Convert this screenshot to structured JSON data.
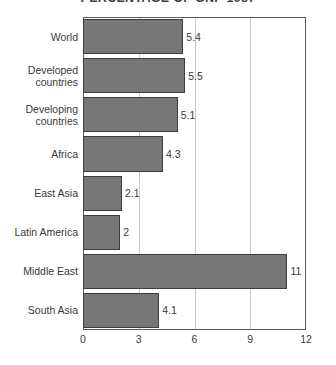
{
  "chart_data": {
    "type": "bar",
    "orientation": "horizontal",
    "title": "PERCENTAGE OF GNP 1987",
    "xlabel": "",
    "ylabel": "",
    "xlim": [
      0,
      12
    ],
    "xticks": [
      "0",
      "3",
      "6",
      "9",
      "12"
    ],
    "xtick_values": [
      0,
      3,
      6,
      9,
      12
    ],
    "grid": "vertical",
    "legend": "none",
    "categories": [
      "World",
      "Developed countries",
      "Developing countries",
      "Africa",
      "East Asia",
      "Latin America",
      "Middle East",
      "South Asia"
    ],
    "values": [
      5.4,
      5.5,
      5.1,
      4.3,
      2.1,
      2,
      11,
      4.1
    ],
    "data_labels": [
      "5.4",
      "5.5",
      "5.1",
      "4.3",
      "2.1",
      "2",
      "11",
      "4.1"
    ],
    "bars": [
      {
        "label": "World",
        "label_lines": [
          "World"
        ],
        "value": 5.4,
        "data_label": "5.4"
      },
      {
        "label": "Developed countries",
        "label_lines": [
          "Developed",
          "countries"
        ],
        "value": 5.5,
        "data_label": "5.5"
      },
      {
        "label": "Developing countries",
        "label_lines": [
          "Developing",
          "countries"
        ],
        "value": 5.1,
        "data_label": "5.1"
      },
      {
        "label": "Africa",
        "label_lines": [
          "Africa"
        ],
        "value": 4.3,
        "data_label": "4.3"
      },
      {
        "label": "East Asia",
        "label_lines": [
          "East Asia"
        ],
        "value": 2.1,
        "data_label": "2.1"
      },
      {
        "label": "Latin America",
        "label_lines": [
          "Latin America"
        ],
        "value": 2,
        "data_label": "2"
      },
      {
        "label": "Middle East",
        "label_lines": [
          "Middle East"
        ],
        "value": 11,
        "data_label": "11"
      },
      {
        "label": "South Asia",
        "label_lines": [
          "South Asia"
        ],
        "value": 4.1,
        "data_label": "4.1"
      }
    ],
    "colors": {
      "bar_fill": "#777777",
      "bar_border": "#3d3d3d",
      "gridline": "#c9c9c9",
      "axis": "#5a5a5a",
      "text": "#3a3a3a",
      "background": "#ffffff"
    }
  }
}
